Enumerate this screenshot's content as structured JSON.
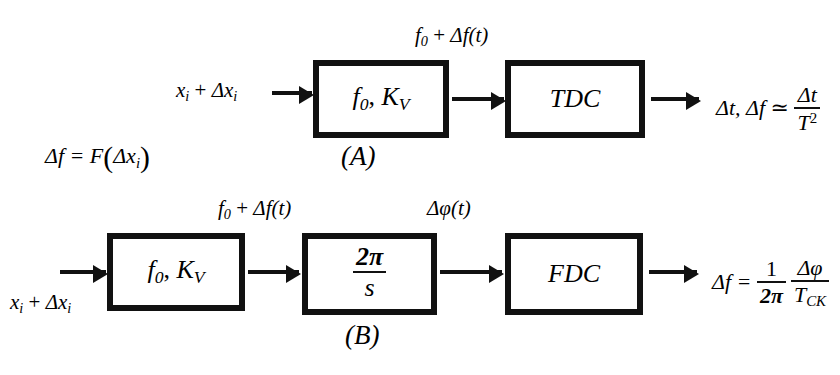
{
  "figure": {
    "type": "block-diagram",
    "background": "#ffffff",
    "line_color": "#111111",
    "panels": [
      {
        "tag": "(A)",
        "input_signal": "x_i + Δx_i",
        "blocks": [
          {
            "label": "f_0, K_V"
          },
          {
            "label": "TDC"
          }
        ],
        "interconnect_signal": "f_0 + Δf(t)",
        "output_expression": "Δt, Δf ≃ Δt / T²"
      },
      {
        "tag": "(B)",
        "input_signal": "x_i + Δx_i",
        "blocks": [
          {
            "label": "f_0, K_V"
          },
          {
            "label": "2π / s"
          },
          {
            "label": "FDC"
          }
        ],
        "interconnect_signal_1": "f_0 + Δf(t)",
        "interconnect_signal_2": "Δφ(t)",
        "output_expression": "Δf = (1 / 2π)(Δφ / T_CK)"
      }
    ],
    "side_equation": "Δf = F(Δx_i)"
  },
  "labels": {
    "panel_a": {
      "input": {
        "base": "x",
        "sub1": "i",
        "plus": " + ",
        "delta": "Δx",
        "sub2": "i"
      },
      "block1": {
        "f": "f",
        "f_sub": "0",
        "comma": ", ",
        "k": "K",
        "k_sub": "V"
      },
      "block2": "TDC",
      "mid_signal": {
        "f": "f",
        "f_sub": "0",
        "plus": " + ",
        "df": "Δf",
        "t": "(t)"
      },
      "out_lead": "Δt, Δf ≃ ",
      "out_num": "Δt",
      "out_den": "T",
      "out_den_sup": "2",
      "tag": "(A)"
    },
    "panel_b": {
      "input": {
        "base": "x",
        "sub1": "i",
        "plus": " + ",
        "delta": "Δx",
        "sub2": "i"
      },
      "block1": {
        "f": "f",
        "f_sub": "0",
        "comma": ", ",
        "k": "K",
        "k_sub": "V"
      },
      "block2_num": "2π",
      "block2_den": "s",
      "block3": "FDC",
      "mid_signal_1": {
        "f": "f",
        "f_sub": "0",
        "plus": " + ",
        "df": "Δf",
        "t": "(t)"
      },
      "mid_signal_2": "Δφ(t)",
      "out_lead": "Δf = ",
      "out_f1_num": "1",
      "out_f1_den": "2π",
      "out_f2_num": "Δφ",
      "out_f2_den": "T",
      "out_f2_den_sub": "CK",
      "tag": "(B)"
    },
    "side_eq": {
      "lead": "Δf = F",
      "open": "(",
      "arg": "Δx",
      "arg_sub": "i",
      "close": ")"
    }
  }
}
